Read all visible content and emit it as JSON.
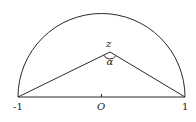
{
  "figure": {
    "type": "upper-half-disk",
    "labels": {
      "point": "z",
      "angle": "α",
      "left_endpoint": "-1",
      "origin": "O",
      "right_endpoint": "1"
    },
    "colors": {
      "stroke": "#2a2a2a",
      "background": "#ffffff"
    }
  }
}
